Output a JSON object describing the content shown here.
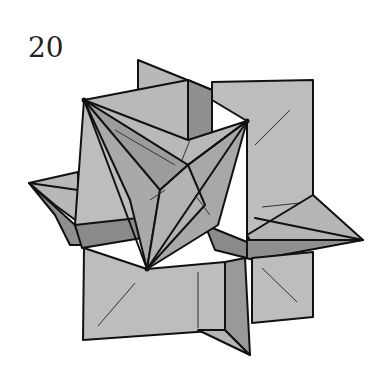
{
  "diagram": {
    "step_number": "20",
    "colors": {
      "light_face": "#bdbdbd",
      "mid_face": "#a9a9a9",
      "dark_face": "#8f8f8f",
      "outline": "#111111",
      "background": "#ffffff"
    }
  }
}
